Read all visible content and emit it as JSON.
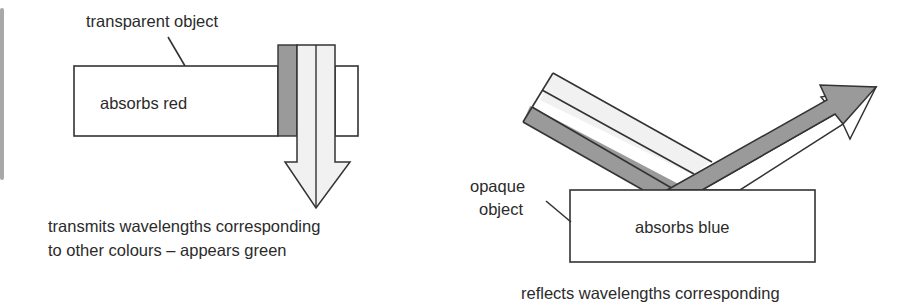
{
  "colors": {
    "stroke": "#333333",
    "dark_band": "#9a9a9a",
    "light_band": "#f1f1f1",
    "white_band": "#ffffff",
    "text": "#2b2b2b",
    "left_edge_bar": "#a8a8a8"
  },
  "left_panel": {
    "object_label": "transparent object",
    "object_text": "absorbs red",
    "caption_line1": "transmits wavelengths corresponding",
    "caption_line2": "to other colours – appears green",
    "light_bands": [
      "dark",
      "light",
      "light"
    ],
    "transmitted_bands": [
      "light",
      "light"
    ]
  },
  "right_panel": {
    "object_label_line1": "opaque",
    "object_label_line2": "object",
    "object_text": "absorbs blue",
    "caption_line1": "reflects wavelengths corresponding",
    "incident_bands": [
      "light",
      "white",
      "dark"
    ],
    "reflected_bands": [
      "dark",
      "white"
    ]
  }
}
